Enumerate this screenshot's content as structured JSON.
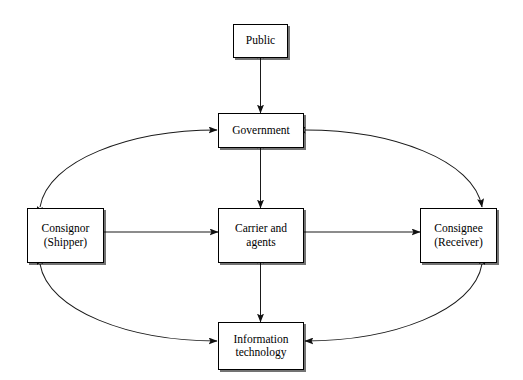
{
  "diagram": {
    "type": "flow-relationship-diagram",
    "canvas": {
      "width": 523,
      "height": 380
    },
    "style": {
      "background": "#ffffff",
      "box_fill": "#ffffff",
      "box_stroke": "#000000",
      "line_stroke": "#1a1a1a",
      "text_color": "#000000",
      "shadow": "#8c8c8c"
    },
    "nodes": [
      {
        "id": "public",
        "label": "Public",
        "x": 233,
        "y": 24,
        "width": 55,
        "height": 34
      },
      {
        "id": "government",
        "label": "Government",
        "x": 218,
        "y": 113,
        "width": 86,
        "height": 35
      },
      {
        "id": "consignor",
        "label": "Consignor\n(Shipper)",
        "x": 27,
        "y": 208,
        "width": 77,
        "height": 55
      },
      {
        "id": "carrier",
        "label": "Carrier and\nagents",
        "x": 218,
        "y": 208,
        "width": 86,
        "height": 55
      },
      {
        "id": "consignee",
        "label": "Consignee\n(Receiver)",
        "x": 420,
        "y": 208,
        "width": 77,
        "height": 55
      },
      {
        "id": "information_technology",
        "label": "Information\ntechnology",
        "x": 218,
        "y": 322,
        "width": 86,
        "height": 48
      }
    ],
    "edges": [
      {
        "id": "public-government",
        "from": "public",
        "to": "government",
        "shape": "straight",
        "direction": "bidirectional",
        "path": "M 260.5 58 L 260.5 113"
      },
      {
        "id": "government-carrier",
        "from": "government",
        "to": "carrier",
        "shape": "straight",
        "direction": "bidirectional",
        "path": "M 260.5 148 L 260.5 208"
      },
      {
        "id": "carrier-information_technology",
        "from": "carrier",
        "to": "information_technology",
        "shape": "straight",
        "direction": "bidirectional",
        "path": "M 260.5 263 L 260.5 322"
      },
      {
        "id": "consignor-carrier",
        "from": "consignor",
        "to": "carrier",
        "shape": "straight",
        "direction": "forward",
        "path": "M 104 232 L 218 232"
      },
      {
        "id": "carrier-consignee",
        "from": "carrier",
        "to": "consignee",
        "shape": "straight",
        "direction": "forward",
        "path": "M 304 232 L 420 232"
      },
      {
        "id": "consignor-government",
        "from": "consignor",
        "to": "government",
        "shape": "curve",
        "direction": "bidirectional",
        "path": "M 40 207 C 48 160 130 130 217 130"
      },
      {
        "id": "government-consignee",
        "from": "government",
        "to": "consignee",
        "shape": "curve",
        "direction": "bidirectional",
        "path": "M 305 130 C 392 130 474 160 482 207"
      },
      {
        "id": "consignor-information_technology",
        "from": "consignor",
        "to": "information_technology",
        "shape": "curve",
        "direction": "bidirectional",
        "path": "M 40 264 C 48 311 130 341 217 341"
      },
      {
        "id": "consignee-information_technology",
        "from": "consignee",
        "to": "information_technology",
        "shape": "curve",
        "direction": "bidirectional",
        "path": "M 482 264 C 474 311 392 341 305 341"
      }
    ]
  }
}
